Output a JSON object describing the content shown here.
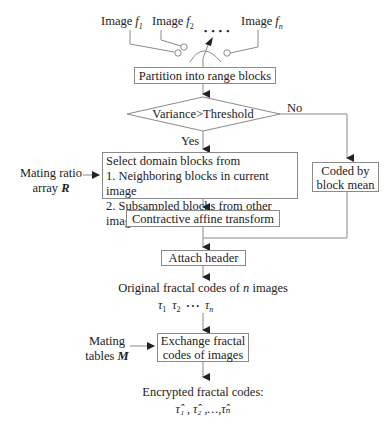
{
  "diagram": {
    "top_cutoff_text": "",
    "inputs": {
      "image1": {
        "prefix": "Image ",
        "var": "f",
        "sub": "1"
      },
      "image2": {
        "prefix": "Image ",
        "var": "f",
        "sub": "2"
      },
      "imagen": {
        "prefix": "Image ",
        "var": "f",
        "sub": "n"
      },
      "ellipsis": "• • • •"
    },
    "nodes": {
      "partition": "Partition into range blocks",
      "decision": "Variance>Threshold",
      "yes_label": "Yes",
      "no_label": "No",
      "select": {
        "line1": "Select domain blocks from",
        "line2": "1. Neighboring blocks in current image",
        "line3": "2. Subsampled blocks from other images"
      },
      "coded": {
        "line1": "Coded by",
        "line2": "block mean"
      },
      "contractive": "Contractive affine transform",
      "attach": "Attach header",
      "original_codes": {
        "prefix": "Original fractal codes of ",
        "var": "n",
        "suffix": " images"
      },
      "taus": {
        "t1": "τ",
        "s1": "1",
        "t2": "τ",
        "s2": "2",
        "dots": "•  •  •",
        "tn": "τ",
        "sn": "n"
      },
      "exchange": {
        "line1": "Exchange fractal",
        "line2": "codes of images"
      },
      "encrypted": {
        "label": "Encrypted fractal codes:",
        "codes": "τ̂₁ , τ̂₂ ,…,τ̂ₙ"
      }
    },
    "side_inputs": {
      "mating_ratio": {
        "line1": "Mating ratio",
        "line2_prefix": "array ",
        "line2_var": "R"
      },
      "mating_tables": {
        "line1": "Mating",
        "line2_prefix": "tables ",
        "line2_var": "M"
      }
    },
    "colors": {
      "line": "#8a8a8a",
      "arrow": "#222222",
      "text": "#222222"
    }
  }
}
